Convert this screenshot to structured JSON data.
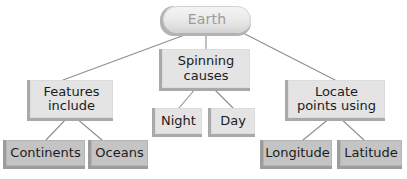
{
  "diagram": {
    "type": "concept-map",
    "title": "Earth",
    "root": {
      "id": "earth",
      "label": "Earth",
      "shape": "rounded-pill",
      "fill": "#ebebeb",
      "text_color": "#9b9b9b"
    },
    "branches": [
      {
        "id": "features-include",
        "label": "Features\ninclude",
        "fill": "#e4e4e4",
        "children": [
          {
            "id": "continents",
            "label": "Continents",
            "fill": "#c4c4c4"
          },
          {
            "id": "oceans",
            "label": "Oceans",
            "fill": "#c4c4c4"
          }
        ]
      },
      {
        "id": "spinning-causes",
        "label": "Spinning\ncauses",
        "fill": "#e4e4e4",
        "children": [
          {
            "id": "night",
            "label": "Night",
            "fill": "#e4e4e4"
          },
          {
            "id": "day",
            "label": "Day",
            "fill": "#e4e4e4"
          }
        ]
      },
      {
        "id": "locate-points-using",
        "label": "Locate\npoints using",
        "fill": "#e4e4e4",
        "children": [
          {
            "id": "longitude",
            "label": "Longitude",
            "fill": "#c4c4c4"
          },
          {
            "id": "latitude",
            "label": "Latitude",
            "fill": "#c4c4c4"
          }
        ]
      }
    ],
    "connector_color": "#8e8e8e",
    "background": "#ffffff"
  }
}
